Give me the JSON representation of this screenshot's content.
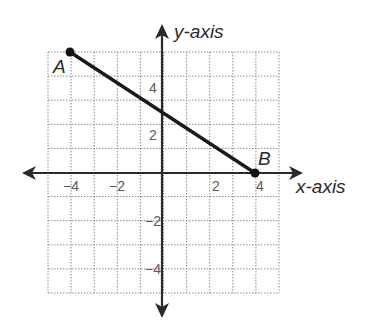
{
  "chart_data": {
    "type": "line",
    "title": "",
    "xlabel": "x-axis",
    "ylabel": "y-axis",
    "xlim": [
      -5,
      5
    ],
    "ylim": [
      -5,
      5
    ],
    "grid": true,
    "grid_step": 1,
    "x_tick_labels": [
      {
        "value": -4,
        "label": "−4"
      },
      {
        "value": -2,
        "label": "−2"
      },
      {
        "value": 2,
        "label": "2"
      },
      {
        "value": 4,
        "label": "4"
      }
    ],
    "y_tick_labels": [
      {
        "value": 4,
        "label": "4"
      },
      {
        "value": 2,
        "label": "2"
      },
      {
        "value": -2,
        "label": "−2"
      },
      {
        "value": -4,
        "label": "−4"
      }
    ],
    "points": [
      {
        "name": "A",
        "x": -4,
        "y": 5
      },
      {
        "name": "B",
        "x": 4,
        "y": 0
      }
    ],
    "series": [
      {
        "name": "segment AB",
        "x": [
          -4,
          4
        ],
        "y": [
          5,
          0
        ]
      }
    ],
    "legend": null
  },
  "labels": {
    "x_axis": "x-axis",
    "y_axis": "y-axis",
    "point_a": "A",
    "point_b": "B",
    "x_tick_neg4": "−4",
    "x_tick_neg2": "−2",
    "x_tick_2": "2",
    "x_tick_4": "4",
    "y_tick_4": "4",
    "y_tick_2": "2",
    "y_tick_neg2": "−2",
    "y_tick_neg4": "−4"
  }
}
